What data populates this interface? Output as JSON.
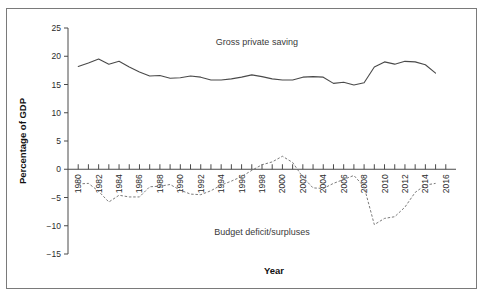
{
  "figure": {
    "border_color": "#7a7a7a",
    "background": "#ffffff"
  },
  "chart_data": {
    "type": "line",
    "title": "",
    "xlabel": "Year",
    "ylabel": "Percentage of GDP",
    "xlim": [
      1979,
      2017
    ],
    "ylim": [
      -15,
      25
    ],
    "yticks": [
      25,
      20,
      15,
      10,
      5,
      0,
      -5,
      -10,
      -15
    ],
    "ytick_labels": [
      "25",
      "20",
      "15",
      "10",
      "5",
      "0",
      "−5",
      "−10",
      "−15"
    ],
    "xticks": [
      1980,
      1981,
      1982,
      1983,
      1984,
      1985,
      1986,
      1987,
      1988,
      1989,
      1990,
      1991,
      1992,
      1993,
      1994,
      1995,
      1996,
      1997,
      1998,
      1999,
      2000,
      2001,
      2002,
      2003,
      2004,
      2005,
      2006,
      2007,
      2008,
      2009,
      2010,
      2011,
      2012,
      2013,
      2014,
      2015,
      2016
    ],
    "xtick_labels_shown": [
      "1980",
      "1982",
      "1984",
      "1986",
      "1988",
      "1990",
      "1992",
      "1994",
      "1996",
      "1998",
      "2000",
      "2002",
      "2004",
      "2006",
      "2008",
      "2010",
      "2012",
      "2014",
      "2016"
    ],
    "grid": false,
    "legend_position": "inline-annotation",
    "annotations": [
      {
        "text": "Gross private saving",
        "x": 1997.5,
        "y": 22.0
      },
      {
        "text": "Budget  deficit/surpluses",
        "x": 1998.0,
        "y": -11.6
      }
    ],
    "x": [
      1980,
      1981,
      1982,
      1983,
      1984,
      1985,
      1986,
      1987,
      1988,
      1989,
      1990,
      1991,
      1992,
      1993,
      1994,
      1995,
      1996,
      1997,
      1998,
      1999,
      2000,
      2001,
      2002,
      2003,
      2004,
      2005,
      2006,
      2007,
      2008,
      2009,
      2010,
      2011,
      2012,
      2013,
      2014,
      2015
    ],
    "series": [
      {
        "name": "Gross private saving",
        "style": "solid",
        "color": "#4a4a4a",
        "values": [
          18.2,
          18.8,
          19.5,
          18.6,
          19.1,
          18.1,
          17.2,
          16.5,
          16.6,
          16.1,
          16.2,
          16.5,
          16.3,
          15.8,
          15.8,
          16.0,
          16.3,
          16.7,
          16.4,
          16.0,
          15.8,
          15.8,
          16.3,
          16.4,
          16.3,
          15.2,
          15.4,
          14.9,
          15.3,
          18.1,
          19.0,
          18.6,
          19.1,
          19.0,
          18.5,
          17.0
        ]
      },
      {
        "name": "Budget deficit/surpluses",
        "style": "dashed",
        "color": "#6b6b6b",
        "values": [
          -2.6,
          -2.5,
          -3.9,
          -5.8,
          -4.6,
          -4.9,
          -4.9,
          -3.1,
          -3.0,
          -2.7,
          -3.7,
          -4.4,
          -4.5,
          -3.8,
          -2.8,
          -2.1,
          -1.3,
          -0.2,
          0.8,
          1.3,
          2.3,
          1.2,
          -1.4,
          -3.3,
          -3.4,
          -2.5,
          -1.8,
          -1.1,
          -3.1,
          -9.8,
          -8.7,
          -8.4,
          -6.7,
          -4.1,
          -2.8,
          -2.5
        ]
      }
    ]
  },
  "axes": {
    "y_title": "Percentage of GDP",
    "x_title": "Year"
  }
}
